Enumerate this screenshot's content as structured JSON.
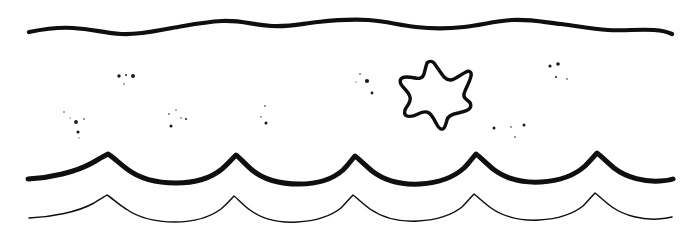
{
  "artwork": {
    "title": "Ocean waves with starfish line art",
    "style": "hand-drawn black ink outline on white",
    "width": 695,
    "height": 235,
    "background_color": "#ffffff",
    "ink_color": "#100f0f"
  },
  "elements": {
    "top_wave": {
      "name": "top wavy line",
      "stroke_width": 4.2,
      "description": "gentle low-amplitude ripple line",
      "y_center": 28,
      "amplitude": 5,
      "x_start": 29,
      "x_end": 672,
      "path": "M29,32 C44,29 58,27 73,28 C92,29 104,33 121,34 C140,35 155,31 172,28 C190,25 203,22 222,21 C241,20 253,25 272,26 C289,27 300,24 318,22 C336,20 350,19 368,20 C386,21 398,25 416,27 C433,29 446,29 464,27 C482,25 494,21 512,20 C530,19 543,22 561,24 C578,26 590,29 608,30 C625,31 638,29 654,30 C662,30.5 668,32 672,34"
    },
    "middle_wave": {
      "name": "bold scalloped wave",
      "stroke_width": 5.0,
      "description": "bold wave with sharp upward cusps and rounded troughs",
      "x_start": 28,
      "x_end": 673,
      "peak_y": 154,
      "trough_y": 182,
      "wavelength": 113,
      "path": "M28,179 C50,178 76,172 92,163 C99,159 104,156 108,154 C113,157 119,163 127,169 C140,179 158,183 176,183 C194,183 211,178 222,169 C229,163 233,158 236,155 C240,158 245,164 252,170 C264,180 281,184 299,184 C317,184 333,179 343,170 C349,164 352,159 355,156 C359,159 365,165 372,171 C385,181 402,185 420,184 C438,183 454,177 464,168 C470,162 473,157 476,154 C480,157 486,163 493,169 C506,179 523,183 541,182 C559,181 575,175 585,166 C591,160 594,156 597,153 C601,156 607,162 614,168 C627,178 645,182 660,181 C666,180.6 670,180 673,179"
    },
    "bottom_wave": {
      "name": "thin scalloped wave",
      "stroke_width": 1.5,
      "description": "thin wave echoing the bold wave below it",
      "x_start": 29,
      "x_end": 672,
      "peak_y": 196,
      "trough_y": 220,
      "wavelength": 113,
      "path": "M29,218 C52,217 78,212 94,203 C100,199 104,197 107,195 C112,198 118,204 126,209 C139,218 157,222 175,222 C193,222 210,217 221,209 C228,203 231,199 234,196 C238,199 243,205 250,210 C262,219 279,223 297,222 C315,221 331,216 341,208 C347,202 350,198 353,195 C357,198 363,204 370,209 C383,218 400,222 418,221 C436,220 452,215 462,207 C468,201 471,197 474,194 C478,197 484,203 491,208 C504,217 521,221 539,220 C557,219 573,214 583,206 C589,200 592,196 595,193 C599,196 605,202 612,207 C625,216 643,220 658,219 C664,218.6 668,218 672,217"
    },
    "starfish": {
      "name": "starfish",
      "description": "hand-drawn five-pointed star outline, wobbly rounded arms, white fill",
      "center_x": 434,
      "center_y": 93,
      "bounding_box": {
        "x": 399,
        "y": 60,
        "width": 73,
        "height": 68
      },
      "points": 5,
      "stroke_width": 3.4,
      "fill_color": "#ffffff",
      "stroke_color": "#0d0d0d",
      "path": "M427,63 C429,61 432,61 434,63 C437,67 440,72 444,77 C447,80 450,81 454,79 C458,77 462,74 466,72 C469,70 472,72 471,76 C470,81 467,86 465,91 C463,95 464,98 467,100 C470,102 472,105 470,108 C468,111 463,112 458,113 C452,114 448,116 447,120 C446,124 445,128 443,129 C440,130 438,127 436,123 C434,119 432,115 429,113 C426,111 422,112 418,114 C414,116 410,117 407,116 C404,115 404,111 406,108 C409,104 411,100 410,97 C409,93 406,90 403,87 C400,84 399,80 402,78 C405,76 410,77 415,78 C419,79 423,78 424,74 C425,70 426,66 427,63 Z"
    },
    "specks": {
      "name": "ink specks",
      "description": "scattered small ink dots between the top wave and middle wave",
      "count": 26,
      "color": "#1a1a1a",
      "dots": [
        {
          "cx": 119,
          "cy": 76,
          "r": 1.7
        },
        {
          "cx": 126,
          "cy": 75,
          "r": 1.0
        },
        {
          "cx": 133,
          "cy": 76,
          "r": 2.0
        },
        {
          "cx": 124,
          "cy": 84,
          "r": 0.7
        },
        {
          "cx": 64,
          "cy": 112,
          "r": 0.7
        },
        {
          "cx": 70,
          "cy": 118,
          "r": 0.6
        },
        {
          "cx": 76,
          "cy": 122,
          "r": 1.9
        },
        {
          "cx": 84,
          "cy": 119,
          "r": 0.8
        },
        {
          "cx": 78,
          "cy": 132,
          "r": 1.6
        },
        {
          "cx": 79,
          "cy": 138,
          "r": 0.6
        },
        {
          "cx": 169,
          "cy": 114,
          "r": 0.8
        },
        {
          "cx": 176,
          "cy": 110,
          "r": 0.7
        },
        {
          "cx": 181,
          "cy": 118,
          "r": 0.7
        },
        {
          "cx": 186,
          "cy": 119,
          "r": 1.0
        },
        {
          "cx": 171,
          "cy": 126,
          "r": 1.5
        },
        {
          "cx": 265,
          "cy": 106,
          "r": 0.8
        },
        {
          "cx": 261,
          "cy": 117,
          "r": 0.7
        },
        {
          "cx": 266,
          "cy": 123,
          "r": 1.5
        },
        {
          "cx": 360,
          "cy": 74,
          "r": 0.8
        },
        {
          "cx": 367,
          "cy": 81,
          "r": 2.1
        },
        {
          "cx": 356,
          "cy": 82,
          "r": 0.6
        },
        {
          "cx": 372,
          "cy": 93,
          "r": 1.4
        },
        {
          "cx": 550,
          "cy": 66,
          "r": 1.6
        },
        {
          "cx": 558,
          "cy": 64,
          "r": 1.8
        },
        {
          "cx": 556,
          "cy": 77,
          "r": 1.0
        },
        {
          "cx": 567,
          "cy": 79,
          "r": 0.8
        },
        {
          "cx": 494,
          "cy": 128,
          "r": 1.5
        },
        {
          "cx": 511,
          "cy": 127,
          "r": 0.8
        },
        {
          "cx": 524,
          "cy": 125,
          "r": 1.5
        },
        {
          "cx": 515,
          "cy": 137,
          "r": 0.8
        }
      ]
    }
  }
}
